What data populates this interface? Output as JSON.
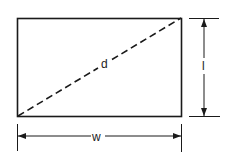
{
  "diagram": {
    "labels": {
      "diagonal": "d",
      "width": "w",
      "length": "l"
    },
    "colors": {
      "stroke": "#1a1a1a",
      "background": "#ffffff"
    }
  }
}
